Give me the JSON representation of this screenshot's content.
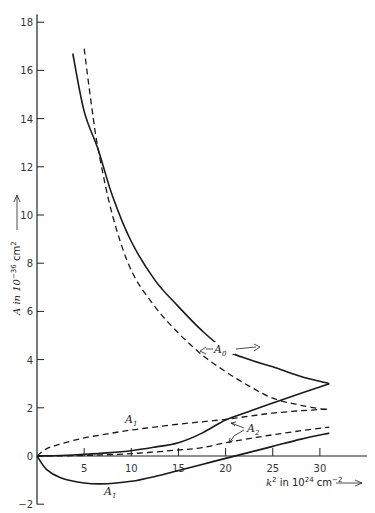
{
  "chart_data": {
    "type": "line",
    "title": "",
    "xlabel": "k² in 10²⁴ cm⁻²",
    "ylabel": "A in 10⁻³⁶ cm²",
    "xlim": [
      0,
      35
    ],
    "ylim": [
      -2,
      18
    ],
    "x_ticks": [
      5,
      10,
      15,
      20,
      25,
      30
    ],
    "y_ticks": [
      -2,
      0,
      2,
      4,
      6,
      8,
      10,
      12,
      14,
      16,
      18
    ],
    "grid": false,
    "legend": "none (inline curve labels)",
    "series": [
      {
        "name": "A0 (solid)",
        "style": "solid",
        "x": [
          3.8,
          5,
          6.5,
          8,
          10,
          12.5,
          15,
          17.5,
          20,
          22.5,
          25,
          28,
          31
        ],
        "y": [
          16.7,
          14.3,
          12.7,
          10.8,
          8.9,
          7.3,
          6.2,
          5.2,
          4.4,
          4.0,
          3.7,
          3.3,
          3.0
        ]
      },
      {
        "name": "A0 (dashed)",
        "style": "dashed",
        "x": [
          5,
          5.8,
          6.5,
          8,
          10,
          12.5,
          15,
          17.5,
          20,
          22.5,
          25,
          28,
          31
        ],
        "y": [
          16.9,
          14.5,
          12.7,
          10.0,
          7.7,
          6.2,
          5.1,
          4.2,
          3.5,
          2.9,
          2.4,
          2.1,
          1.9
        ]
      },
      {
        "name": "A1 (solid)",
        "style": "solid",
        "x": [
          0,
          1,
          2.5,
          5,
          7.5,
          10,
          12.5,
          15,
          17.5,
          20,
          22.5,
          25,
          28,
          31
        ],
        "y": [
          0,
          -0.55,
          -0.9,
          -1.12,
          -1.15,
          -1.05,
          -0.85,
          -0.6,
          -0.35,
          -0.1,
          0.15,
          0.4,
          0.7,
          0.95
        ]
      },
      {
        "name": "A1 (dashed)",
        "style": "dashed",
        "x": [
          0,
          1,
          2.5,
          5,
          7.5,
          10,
          12.5,
          15,
          17.5,
          20,
          22.5,
          25,
          28,
          31
        ],
        "y": [
          0,
          0.3,
          0.5,
          0.75,
          0.92,
          1.08,
          1.2,
          1.32,
          1.42,
          1.52,
          1.65,
          1.78,
          1.88,
          1.95
        ]
      },
      {
        "name": "A2 (solid)",
        "style": "solid",
        "x": [
          0,
          2.5,
          5,
          7.5,
          10,
          12.5,
          15,
          17.5,
          20,
          22.5,
          25,
          28,
          31
        ],
        "y": [
          0,
          0.02,
          0.07,
          0.13,
          0.22,
          0.37,
          0.55,
          0.95,
          1.5,
          1.85,
          2.2,
          2.6,
          3.0
        ]
      },
      {
        "name": "A2 (dashed)",
        "style": "dashed",
        "x": [
          0,
          5,
          10,
          15,
          17.5,
          20,
          22.5,
          25,
          28,
          31
        ],
        "y": [
          0,
          0.02,
          0.1,
          0.25,
          0.35,
          0.55,
          0.72,
          0.88,
          1.05,
          1.2
        ]
      }
    ],
    "annotations": [
      {
        "text": "A0",
        "x": 19.5,
        "y": 4.6,
        "note": "double-arrow label pointing to solid and dashed A0"
      },
      {
        "text": "A1",
        "x": 9.5,
        "y": 1.45,
        "note": "label above dashed A1"
      },
      {
        "text": "A1",
        "x": 7.7,
        "y": -1.6,
        "note": "label below solid A1"
      },
      {
        "text": "A2",
        "x": 22.2,
        "y": 0.9,
        "note": "arrows to solid and dashed A2"
      }
    ]
  },
  "labels": {
    "y_axis": "A in 10",
    "y_axis_exp": "−36",
    "y_axis_unit": " cm",
    "y_axis_unit_exp": "2",
    "x_axis": "k",
    "x_axis_exp": "2",
    "x_axis_mid": " in 10",
    "x_axis_exp2": "24",
    "x_axis_unit": " cm",
    "x_axis_unit_exp": "−2",
    "a0": "A",
    "a0_sub": "0",
    "a1": "A",
    "a1_sub": "1",
    "a2": "A",
    "a2_sub": "2"
  }
}
